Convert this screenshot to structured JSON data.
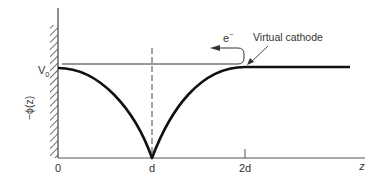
{
  "diagram": {
    "y_axis_label": "−ϕ(z)",
    "x_axis_label": "z",
    "v0_label": "V",
    "v0_sub": "0",
    "x_ticks": [
      {
        "label": "0"
      },
      {
        "label": "d"
      },
      {
        "label": "2d"
      }
    ],
    "electron_label": "e",
    "electron_sup": "−",
    "annotation": "Virtual cathode",
    "colors": {
      "curve": "#111111",
      "axis": "#444444",
      "text": "#333333"
    }
  }
}
